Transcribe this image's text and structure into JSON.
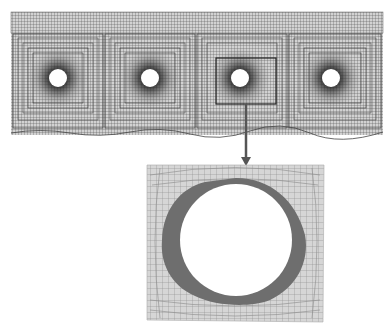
{
  "figure": {
    "top_mesh": {
      "bounds": {
        "x": 11,
        "y": 12,
        "width": 372,
        "height": 123
      },
      "openings": [
        {
          "id": 1,
          "cx": 58,
          "cy": 78,
          "r": 9
        },
        {
          "id": 2,
          "cx": 150,
          "cy": 78,
          "r": 9
        },
        {
          "id": 3,
          "cx": 240,
          "cy": 78,
          "r": 9
        },
        {
          "id": 4,
          "cx": 331,
          "cy": 78,
          "r": 9
        }
      ],
      "highlight_box": {
        "x": 216,
        "y": 58,
        "width": 60,
        "height": 46
      }
    },
    "detail_panel": {
      "bounds": {
        "x": 147,
        "y": 165,
        "width": 178,
        "height": 157
      },
      "opening": {
        "cx": 236,
        "cy": 240,
        "r": 56
      },
      "plastic_zone_color": "#6e6e6e"
    },
    "colors": {
      "mesh_line": "#3a3a3a",
      "mesh_bg": "#c8c8c8",
      "arrow": "#555555",
      "box": "#222222"
    }
  }
}
